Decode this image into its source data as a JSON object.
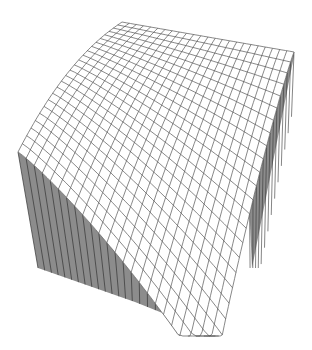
{
  "chart_data": {
    "type": "surface3d",
    "title": "",
    "xlabel": "",
    "ylabel": "",
    "zlabel": "",
    "axes_visible": false,
    "grid": {
      "u_lines": 24,
      "v_lines": 24
    },
    "style": {
      "mesh_color": "#555555",
      "surface_fill": "#ffffff",
      "wall_fill": "#8c8c8c",
      "wall_line": "#333333",
      "background": "#ffffff"
    },
    "view": {
      "corner_back": [
        122,
        22
      ],
      "corner_left": [
        18,
        92
      ],
      "corner_right": [
        294,
        52
      ],
      "corner_front": [
        212,
        332
      ],
      "left_wall_bottom": [
        [
          38,
          268
        ],
        [
          135,
          302
        ]
      ],
      "right_wall_bottom": [
        252,
        268
      ]
    }
  }
}
